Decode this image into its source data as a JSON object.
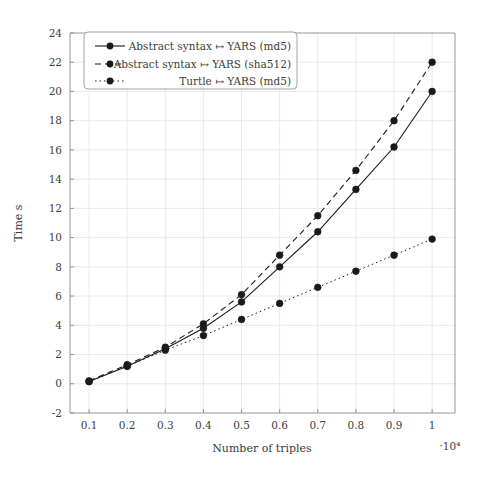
{
  "chart_data": {
    "type": "line",
    "title": "",
    "xlabel": "Number of triples",
    "ylabel": "Time s",
    "x_exponent_label": "·10⁴",
    "x": [
      0.1,
      0.2,
      0.3,
      0.4,
      0.5,
      0.6,
      0.7,
      0.8,
      0.9,
      1
    ],
    "xticklabels": [
      "0.1",
      "0.2",
      "0.3",
      "0.4",
      "0.5",
      "0.6",
      "0.7",
      "0.8",
      "0.9",
      "1"
    ],
    "yticklabels": [
      "-2",
      "0",
      "2",
      "4",
      "6",
      "8",
      "10",
      "12",
      "14",
      "16",
      "18",
      "20",
      "22",
      "24"
    ],
    "xlim": [
      0.05,
      1.06
    ],
    "ylim": [
      -2,
      24
    ],
    "grid": true,
    "legend_position": "top-left",
    "series": [
      {
        "name": "Abstract syntax ↦ YARS (md5)",
        "style": "solid",
        "marker": "circle",
        "color": "#1a1a1a",
        "values": [
          0.15,
          1.2,
          2.4,
          3.8,
          5.6,
          8.0,
          10.4,
          13.3,
          16.2,
          20.0
        ]
      },
      {
        "name": "Abstract syntax ↦ YARS (sha512)",
        "style": "dashed",
        "marker": "circle",
        "color": "#1a1a1a",
        "values": [
          0.2,
          1.3,
          2.5,
          4.1,
          6.1,
          8.8,
          11.5,
          14.6,
          18.0,
          22.0
        ]
      },
      {
        "name": "Turtle ↦ YARS (md5)",
        "style": "dotted",
        "marker": "circle",
        "color": "#1a1a1a",
        "values": [
          0.15,
          1.2,
          2.3,
          3.3,
          4.4,
          5.5,
          6.6,
          7.7,
          8.8,
          9.9
        ]
      }
    ]
  },
  "legend": {
    "entries": [
      {
        "label": "Abstract syntax ↦ YARS (md5)",
        "style": "solid"
      },
      {
        "label": "Abstract syntax ↦ YARS (sha512)",
        "style": "dashed"
      },
      {
        "label": "Turtle ↦ YARS (md5)",
        "style": "dotted"
      }
    ]
  }
}
